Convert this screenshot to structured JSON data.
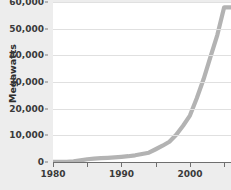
{
  "chart_data": {
    "type": "line",
    "title": "",
    "title_visible": false,
    "xlabel": "",
    "ylabel": "Megawatts",
    "xlim": [
      1980,
      2006
    ],
    "ylim": [
      0,
      60000
    ],
    "grid": true,
    "legend": false,
    "series_color": "#b3b3b3",
    "x_tick_labels": [
      "1980",
      "1990",
      "2000"
    ],
    "x_major_ticks": [
      1980,
      1990,
      2000
    ],
    "x_minor_ticks": [
      1985,
      1995,
      2005
    ],
    "y_tick_labels": [
      "0",
      "10,000",
      "20,000",
      "30,000",
      "40,000",
      "50,000",
      "60,000"
    ],
    "y_ticks": [
      0,
      10000,
      20000,
      30000,
      40000,
      50000,
      60000
    ],
    "series": [
      {
        "name": "Capacity",
        "x": [
          1980,
          1981,
          1982,
          1983,
          1984,
          1985,
          1986,
          1987,
          1988,
          1989,
          1990,
          1991,
          1992,
          1993,
          1994,
          1995,
          1996,
          1997,
          1998,
          1999,
          2000,
          2001,
          2002,
          2003,
          2004,
          2005,
          2006
        ],
        "values": [
          10,
          25,
          90,
          210,
          600,
          1020,
          1270,
          1450,
          1580,
          1730,
          1930,
          2170,
          2510,
          2990,
          3490,
          4780,
          6100,
          7600,
          10200,
          13600,
          17400,
          23900,
          31100,
          39400,
          47600,
          58000,
          58000
        ]
      }
    ]
  },
  "axis": {
    "y_title": "Megawatts"
  }
}
